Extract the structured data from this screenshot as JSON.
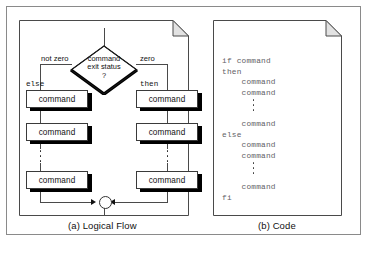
{
  "figure": {
    "panels": [
      {
        "id": "logical-flow",
        "caption": "(a) Logical Flow"
      },
      {
        "id": "code",
        "caption": "(b) Code"
      }
    ]
  },
  "flow": {
    "decision": {
      "line1": "command",
      "line2": "exit status",
      "line3": "?"
    },
    "edge_labels": {
      "left": "not zero",
      "right": "zero"
    },
    "branch_labels": {
      "left": "else",
      "right": "then"
    },
    "left_branch_boxes": [
      {
        "label": "command"
      },
      {
        "label": "command"
      },
      {
        "label": "command"
      }
    ],
    "right_branch_boxes": [
      {
        "label": "command"
      },
      {
        "label": "command"
      },
      {
        "label": "command"
      }
    ],
    "ellipsis": "vertical-dots",
    "merge_node": "merge-circle"
  },
  "code": {
    "lines": [
      "if command",
      "then",
      "    command",
      "    command",
      "",
      "    command",
      "else",
      "    command",
      "    command",
      "",
      "    command",
      "fi"
    ],
    "text_top": "if command\nthen\n    command\n    command",
    "text_mid": "    command\nelse\n    command\n    command",
    "text_bottom": "    command\nfi"
  },
  "colors": {
    "frame": "#8a8a8a",
    "page_border": "#4a4a4a",
    "shadow": "#000000",
    "code_text": "#5f6166",
    "box_text": "#111111",
    "fold_fill": "#e2e2e2"
  }
}
